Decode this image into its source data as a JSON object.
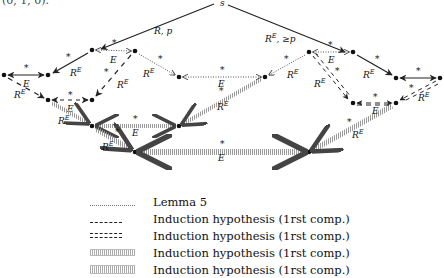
{
  "top_fragment": "(0, 1, 0).",
  "diagram": {
    "source_node": "s",
    "edge_labels": {
      "s_left": "R, p",
      "s_right": "R^E, ≥p",
      "star": "*",
      "E": "E",
      "RE": "R^E"
    }
  },
  "legend": [
    {
      "style": "dotted",
      "label": "Lemma 5"
    },
    {
      "style": "dashed",
      "label": "Induction hypothesis (1rst comp.)"
    },
    {
      "style": "double-dashed",
      "label": "Induction hypothesis (1rst comp.)"
    },
    {
      "style": "hatched-narrow",
      "label": "Induction hypothesis (1rst comp.)"
    },
    {
      "style": "hatched-wide",
      "label": "Induction hypothesis (1rst comp.)"
    }
  ]
}
